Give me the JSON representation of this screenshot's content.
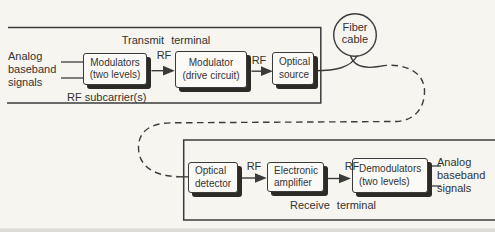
{
  "diagram": {
    "transmit": {
      "title": "Transmit terminal",
      "input_signal": {
        "line1": "Analog",
        "line2": "baseband",
        "line3": "signals"
      },
      "subcarrier_label": "RF subcarrier(s)",
      "rf_labels": [
        "RF",
        "RF"
      ],
      "boxes": [
        {
          "line1": "Modulators",
          "line2": "(two levels)"
        },
        {
          "line1": "Modulator",
          "line2": "(drive circuit)"
        },
        {
          "line1": "Optical",
          "line2": "source"
        }
      ]
    },
    "fiber_cable": {
      "line1": "Fiber",
      "line2": "cable"
    },
    "receive": {
      "title": "Receive terminal",
      "rf_labels": [
        "RF",
        "RF"
      ],
      "output_signal": {
        "line1": "Analog",
        "line2": "baseband",
        "line3": "signals"
      },
      "boxes": [
        {
          "line1": "Optical",
          "line2": "detector"
        },
        {
          "line1": "Electronic",
          "line2": "amplifier"
        },
        {
          "line1": "Demodulators",
          "line2": "(two levels)"
        }
      ]
    },
    "colors": {
      "ink": "#3b3b3b",
      "paper": "#f6f5f0",
      "box_shadow": "#2e2b27"
    }
  }
}
